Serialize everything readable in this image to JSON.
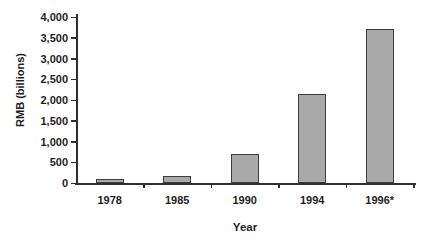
{
  "figure": {
    "background": "#ffffff",
    "text_color": "#1e1e1e",
    "axis_color": "#2e2e2e",
    "bar_fill": "#a9a9a9",
    "bar_border": "#3c3c3c"
  },
  "chart_data": {
    "type": "bar",
    "categories": [
      "1978",
      "1985",
      "1990",
      "1994",
      "1996*"
    ],
    "values": [
      50,
      160,
      700,
      2150,
      3700
    ],
    "title": "",
    "xlabel": "Year",
    "ylabel": "RMB (billions)",
    "ylim": [
      0,
      4000
    ],
    "ytick_step": 500,
    "ytick_labels": [
      "0",
      "500",
      "1,000",
      "1,500",
      "2,000",
      "2,500",
      "3,000",
      "3,500",
      "4,000"
    ],
    "grid": false,
    "legend": false
  }
}
